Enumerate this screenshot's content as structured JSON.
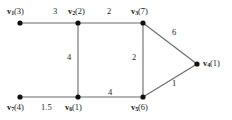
{
  "figure": {
    "type": "weighted-undirected-graph",
    "background": "#ffffff",
    "edge_color": "#6b6b6b",
    "vertex_color": "#111111"
  },
  "vertices": [
    {
      "id": "v1",
      "name": "v",
      "sub": "1",
      "value": "(3)",
      "label": "v1(3)",
      "x": 20,
      "y": 23,
      "label_x": 7,
      "label_y": 7,
      "anchor": "top-left"
    },
    {
      "id": "v2",
      "name": "v",
      "sub": "2",
      "value": "(2)",
      "label": "v2(2)",
      "x": 78,
      "y": 23,
      "label_x": 68,
      "label_y": 7,
      "anchor": "top-left"
    },
    {
      "id": "v3",
      "name": "v",
      "sub": "3",
      "value": "(7)",
      "label": "v3(7)",
      "x": 143,
      "y": 23,
      "label_x": 131,
      "label_y": 7,
      "anchor": "top-left"
    },
    {
      "id": "v4",
      "name": "v",
      "sub": "4",
      "value": "(1)",
      "label": "v4(1)",
      "x": 197,
      "y": 64,
      "label_x": 203,
      "label_y": 59,
      "anchor": "right"
    },
    {
      "id": "v5",
      "name": "v",
      "sub": "5",
      "value": "(6)",
      "label": "v5(6)",
      "x": 143,
      "y": 97,
      "label_x": 131,
      "label_y": 103,
      "anchor": "bottom"
    },
    {
      "id": "v6",
      "name": "v",
      "sub": "6",
      "value": "(1)",
      "label": "v6(1)",
      "x": 78,
      "y": 97,
      "label_x": 65,
      "label_y": 103,
      "anchor": "bottom"
    },
    {
      "id": "v7",
      "name": "v",
      "sub": "7",
      "value": "(4)",
      "label": "v7(4)",
      "x": 20,
      "y": 97,
      "label_x": 7,
      "label_y": 103,
      "anchor": "bottom-left"
    }
  ],
  "edges": [
    {
      "from": "v1",
      "to": "v2",
      "weight": "3",
      "label_x": 53,
      "label_y": 7
    },
    {
      "from": "v2",
      "to": "v3",
      "weight": "2",
      "label_x": 107,
      "label_y": 7
    },
    {
      "from": "v2",
      "to": "v6",
      "weight": "4",
      "label_x": 67,
      "label_y": 53
    },
    {
      "from": "v3",
      "to": "v4",
      "weight": "6",
      "label_x": 172,
      "label_y": 28
    },
    {
      "from": "v3",
      "to": "v5",
      "weight": "2",
      "label_x": 132,
      "label_y": 53
    },
    {
      "from": "v4",
      "to": "v5",
      "weight": "1",
      "label_x": 172,
      "label_y": 79
    },
    {
      "from": "v5",
      "to": "v6",
      "weight": "4",
      "label_x": 108,
      "label_y": 88
    },
    {
      "from": "v6",
      "to": "v7",
      "weight": "1.5",
      "label_x": 41,
      "label_y": 103
    }
  ]
}
